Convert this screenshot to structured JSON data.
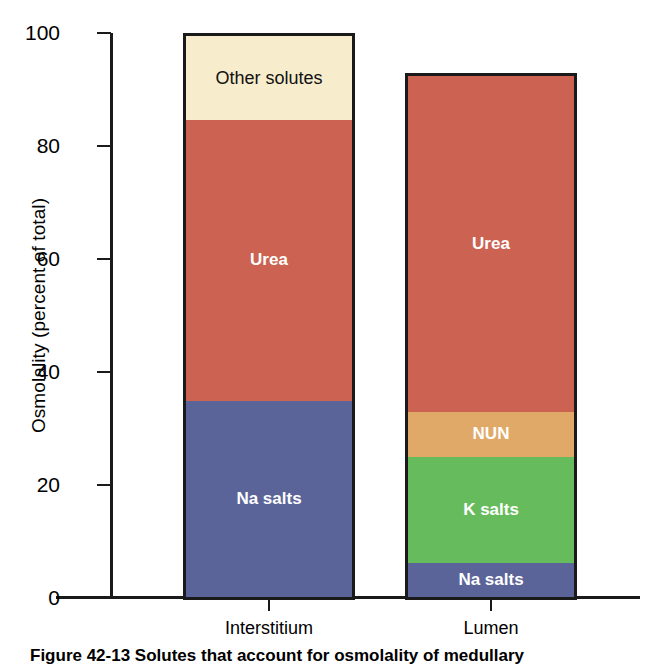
{
  "chart_data": {
    "type": "bar",
    "subtype": "stacked-bar",
    "title": "",
    "xlabel": "",
    "ylabel": "Osmolality (percent of total)",
    "ylim": [
      0,
      100
    ],
    "yticks": [
      0,
      20,
      40,
      60,
      80,
      100
    ],
    "ytick_labels": [
      "0",
      "20",
      "40",
      "60",
      "80",
      "100"
    ],
    "grid": false,
    "legend": false,
    "legend_position": "none",
    "categories": [
      "Interstitium",
      "Lumen"
    ],
    "series": [
      {
        "name": "Na salts",
        "values": [
          35,
          6
        ],
        "color": "#5b6499",
        "label_color": "#ffffff"
      },
      {
        "name": "K salts",
        "values": [
          0,
          19
        ],
        "color": "#66bc5c",
        "label_color": "#ffffff"
      },
      {
        "name": "NUN",
        "values": [
          0,
          8
        ],
        "color": "#e0a968",
        "label_color": "#ffffff"
      },
      {
        "name": "Urea",
        "values": [
          50,
          60
        ],
        "color": "#cc6352",
        "label_color": "#ffffff"
      },
      {
        "name": "Other solutes",
        "values": [
          15,
          0
        ],
        "color": "#f7edcd",
        "label_color": "#111111"
      }
    ],
    "bars": [
      {
        "category": "Interstitium",
        "total": 100,
        "segments": [
          {
            "label": "Other solutes",
            "from": 85,
            "to": 100,
            "value": 15,
            "color": "#f7edcd",
            "label_color": "#111111"
          },
          {
            "label": "Urea",
            "from": 35,
            "to": 85,
            "value": 50,
            "color": "#cc6352",
            "label_color": "#ffffff"
          },
          {
            "label": "Na salts",
            "from": 0,
            "to": 35,
            "value": 35,
            "color": "#5b6499",
            "label_color": "#ffffff"
          }
        ]
      },
      {
        "category": "Lumen",
        "total": 93,
        "segments": [
          {
            "label": "Urea",
            "from": 33,
            "to": 93,
            "value": 60,
            "color": "#cc6352",
            "label_color": "#ffffff"
          },
          {
            "label": "NUN",
            "from": 25,
            "to": 33,
            "value": 8,
            "color": "#e0a968",
            "label_color": "#ffffff"
          },
          {
            "label": "K salts",
            "from": 6,
            "to": 25,
            "value": 19,
            "color": "#66bc5c",
            "label_color": "#ffffff"
          },
          {
            "label": "Na salts",
            "from": 0,
            "to": 6,
            "value": 6,
            "color": "#5b6499",
            "label_color": "#ffffff"
          }
        ]
      }
    ]
  },
  "axis": {
    "y_label": "Osmolality (percent of total)",
    "y_ticks": [
      {
        "value": 100,
        "label": "100"
      },
      {
        "value": 80,
        "label": "80"
      },
      {
        "value": 60,
        "label": "60"
      },
      {
        "value": 40,
        "label": "40"
      },
      {
        "value": 20,
        "label": "20"
      },
      {
        "value": 0,
        "label": "0"
      }
    ],
    "x_ticks": [
      {
        "label": "Interstitium"
      },
      {
        "label": "Lumen"
      }
    ]
  },
  "caption": {
    "text": "Figure 42-13   Solutes that account for osmolality of medullary"
  },
  "colors": {
    "na_salts": "#5b6499",
    "k_salts": "#66bc5c",
    "nun": "#e0a968",
    "urea": "#cc6352",
    "other_solutes": "#f7edcd",
    "axis": "#1a1a1a",
    "background": "#ffffff"
  }
}
